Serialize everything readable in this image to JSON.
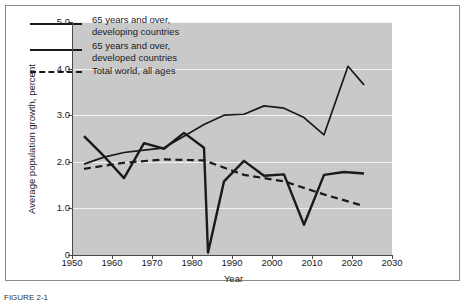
{
  "chart_data": {
    "type": "line",
    "title": "",
    "xlabel": "Year",
    "ylabel": "Average population growth, percent",
    "xlim": [
      1950,
      2030
    ],
    "ylim": [
      0,
      5
    ],
    "xticks": [
      "1950",
      "1960",
      "1970",
      "1980",
      "1990",
      "2000",
      "2010",
      "2020",
      "2030"
    ],
    "yticks": [
      "0",
      "1.0",
      "2.0",
      "3.0",
      "4.0",
      "5.0"
    ],
    "grid": true,
    "legend_position": "upper-left",
    "plot_background": "#c9c9c9",
    "line_color": "#1a1a1a",
    "series": [
      {
        "name": "65 years and over, developing countries",
        "style": "solid",
        "x": [
          1953,
          1958,
          1963,
          1968,
          1973,
          1978,
          1983,
          1988,
          1993,
          1998,
          2003,
          2008,
          2013,
          2019,
          2023
        ],
        "values": [
          1.95,
          2.1,
          2.2,
          2.25,
          2.3,
          2.55,
          2.8,
          3.0,
          3.02,
          3.2,
          3.15,
          2.95,
          2.58,
          4.05,
          3.65
        ]
      },
      {
        "name": "65 years and over, developed countries",
        "style": "solid",
        "x": [
          1953,
          1958,
          1963,
          1968,
          1973,
          1978,
          1983,
          1984,
          1988,
          1993,
          1998,
          2003,
          2008,
          2013,
          2018,
          2023
        ],
        "values": [
          2.55,
          2.12,
          1.65,
          2.4,
          2.28,
          2.62,
          2.3,
          0.05,
          1.58,
          2.02,
          1.7,
          1.73,
          0.65,
          1.72,
          1.78,
          1.75
        ]
      },
      {
        "name": "Total world, all ages",
        "style": "dashed",
        "x": [
          1953,
          1963,
          1973,
          1983,
          1993,
          2003,
          2013,
          2023
        ],
        "values": [
          1.85,
          1.98,
          2.05,
          2.03,
          1.72,
          1.58,
          1.3,
          1.05
        ]
      }
    ]
  },
  "legend": {
    "items": [
      {
        "line1": "65 years and over,",
        "line2": "developing countries",
        "style": "solid"
      },
      {
        "line1": "65 years and over,",
        "line2": "developed countries",
        "style": "solid"
      },
      {
        "line1": "Total world, all ages",
        "line2": "",
        "style": "dashed"
      }
    ]
  },
  "caption": "FIGURE 2-1"
}
